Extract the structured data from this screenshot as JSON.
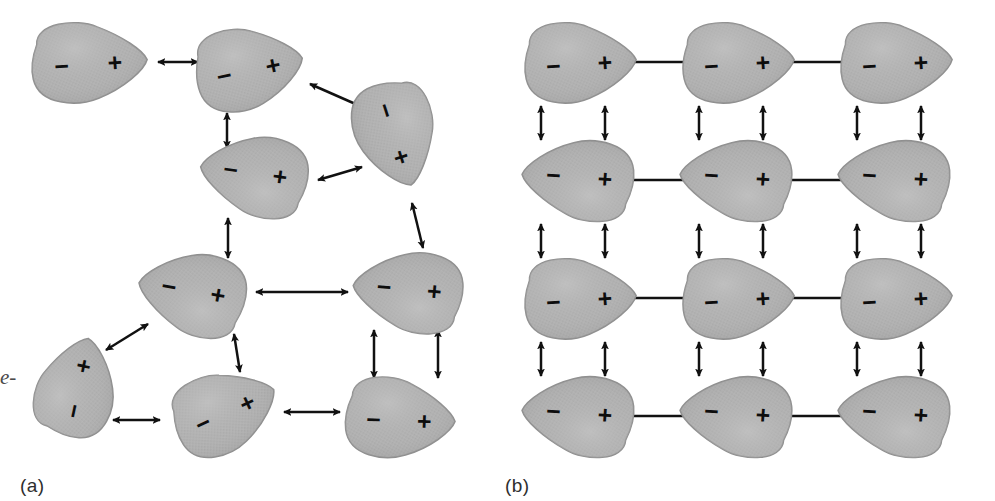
{
  "figure": {
    "width": 995,
    "height": 501,
    "background": "#ffffff",
    "margin_text": "e-",
    "panels": [
      {
        "id": "a",
        "label": "(a)",
        "description": "disordered dipoles"
      },
      {
        "id": "b",
        "label": "(b)",
        "description": "ordered antiparallel dipole lattice"
      }
    ]
  },
  "style": {
    "dipole_fill": "#b2b2b2",
    "dipole_stroke": "#8f8f8f",
    "dipole_highlight": "#c4c4c4",
    "arrow_color": "#111111",
    "sign_color": "#0d0d0d",
    "label_color": "#2e2e2e"
  },
  "signs": {
    "positive": "+",
    "negative": "−"
  },
  "panel_a": {
    "label": "(a)",
    "dipoles": [
      {
        "name": "dipole-a1",
        "cx": 88,
        "cy": 62,
        "rx": 58,
        "ry": 40,
        "rot": -4,
        "left_sign": "−",
        "right_sign": "+"
      },
      {
        "name": "dipole-a2",
        "cx": 248,
        "cy": 68,
        "rx": 54,
        "ry": 41,
        "rot": -12,
        "left_sign": "−",
        "right_sign": "+"
      },
      {
        "name": "dipole-a3",
        "cx": 396,
        "cy": 133,
        "rx": 53,
        "ry": 40,
        "rot": 72,
        "left_sign": "−",
        "right_sign": "+"
      },
      {
        "name": "dipole-a4",
        "cx": 255,
        "cy": 176,
        "rx": 54,
        "ry": 40,
        "rot": 188,
        "left_sign": "+",
        "right_sign": "−"
      },
      {
        "name": "dipole-a5",
        "cx": 193,
        "cy": 294,
        "rx": 54,
        "ry": 41,
        "rot": 190,
        "left_sign": "+",
        "right_sign": "−"
      },
      {
        "name": "dipole-a6",
        "cx": 409,
        "cy": 292,
        "rx": 55,
        "ry": 40,
        "rot": 185,
        "left_sign": "+",
        "right_sign": "−"
      },
      {
        "name": "dipole-a7",
        "cx": 76,
        "cy": 388,
        "rx": 50,
        "ry": 39,
        "rot": -78,
        "left_sign": "−",
        "right_sign": "+"
      },
      {
        "name": "dipole-a8",
        "cx": 224,
        "cy": 411,
        "rx": 53,
        "ry": 40,
        "rot": -25,
        "left_sign": "−",
        "right_sign": "+"
      },
      {
        "name": "dipole-a9",
        "cx": 399,
        "cy": 418,
        "rx": 55,
        "ry": 40,
        "rot": 2,
        "left_sign": "−",
        "right_sign": "+"
      }
    ],
    "arrows": [
      {
        "name": "arrow-a-1",
        "x1": 158,
        "y1": 62,
        "x2": 198,
        "y2": 62
      },
      {
        "name": "arrow-a-2",
        "x1": 310,
        "y1": 84,
        "x2": 360,
        "y2": 106
      },
      {
        "name": "arrow-a-3",
        "x1": 227,
        "y1": 113,
        "x2": 227,
        "y2": 148
      },
      {
        "name": "arrow-a-4",
        "x1": 318,
        "y1": 180,
        "x2": 362,
        "y2": 167
      },
      {
        "name": "arrow-a-5",
        "x1": 412,
        "y1": 203,
        "x2": 423,
        "y2": 248
      },
      {
        "name": "arrow-a-6",
        "x1": 228,
        "y1": 218,
        "x2": 228,
        "y2": 258
      },
      {
        "name": "arrow-a-7",
        "x1": 256,
        "y1": 292,
        "x2": 348,
        "y2": 292
      },
      {
        "name": "arrow-a-8",
        "x1": 106,
        "y1": 350,
        "x2": 148,
        "y2": 324
      },
      {
        "name": "arrow-a-9",
        "x1": 234,
        "y1": 334,
        "x2": 240,
        "y2": 372
      },
      {
        "name": "arrow-a-10",
        "x1": 374,
        "y1": 330,
        "x2": 374,
        "y2": 378
      },
      {
        "name": "arrow-a-11",
        "x1": 438,
        "y1": 330,
        "x2": 438,
        "y2": 378
      },
      {
        "name": "arrow-a-12",
        "x1": 113,
        "y1": 420,
        "x2": 160,
        "y2": 420
      },
      {
        "name": "arrow-a-13",
        "x1": 284,
        "y1": 412,
        "x2": 340,
        "y2": 412
      }
    ]
  },
  "panel_b": {
    "label": "(b)",
    "columns_x": [
      82,
      240,
      398
    ],
    "rows_y": [
      62,
      180,
      298,
      416
    ],
    "dipole_rx": 56,
    "dipole_ry": 40,
    "row_orientation": [
      {
        "row": 0,
        "rot": -4,
        "left_sign": "−",
        "right_sign": "+"
      },
      {
        "row": 1,
        "rot": 184,
        "left_sign": "+",
        "right_sign": "−"
      },
      {
        "row": 2,
        "rot": -4,
        "left_sign": "−",
        "right_sign": "+"
      },
      {
        "row": 3,
        "rot": 184,
        "left_sign": "+",
        "right_sign": "−"
      }
    ],
    "horizontal_arrow_x": [
      161,
      319
    ],
    "vertical_arrow_dx": [
      -38,
      26
    ],
    "vertical_gap_y": [
      {
        "y1": 106,
        "y2": 140
      },
      {
        "y1": 224,
        "y2": 258
      },
      {
        "y1": 342,
        "y2": 376
      }
    ],
    "horizontal_arrow_halfspan": 34
  }
}
